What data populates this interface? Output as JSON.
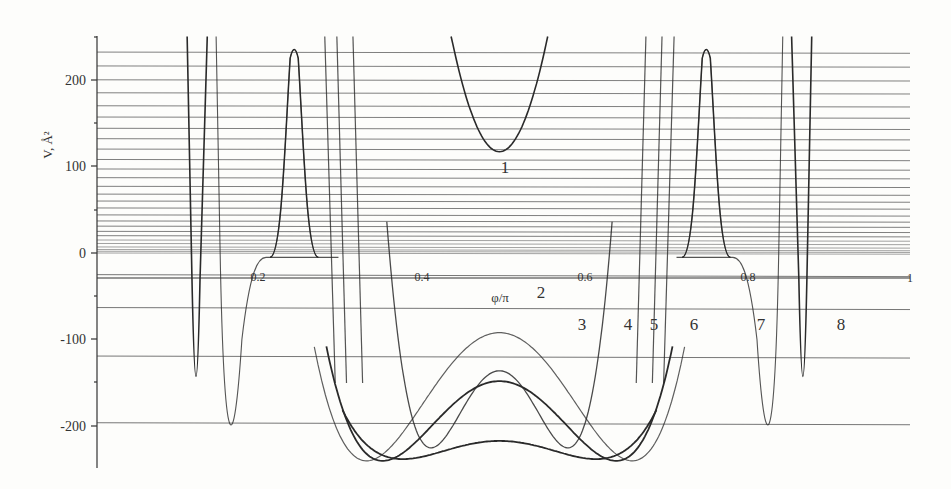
{
  "chart_data": {
    "type": "line",
    "title": "",
    "xlabel": "φ/π",
    "ylabel": "V, Å²",
    "xlim": [
      0,
      1
    ],
    "ylim": [
      -250,
      250
    ],
    "x_ticks": [
      0.2,
      0.4,
      0.6,
      0.8,
      1
    ],
    "x_tick_labels": [
      "0.2",
      "0.4",
      "0.6",
      "0.8",
      "1"
    ],
    "y_ticks": [
      -200,
      -100,
      0,
      100,
      200
    ],
    "y_tick_labels": [
      "-200",
      "-100",
      "0",
      "100",
      "200"
    ],
    "grid": false,
    "legend": "inline curve numbers",
    "energy_levels_upper": [
      232,
      216,
      200,
      185,
      170,
      157,
      144,
      132,
      120,
      108,
      97,
      87,
      77,
      68,
      60,
      52,
      44,
      37,
      31,
      25,
      20,
      15,
      11,
      7,
      4,
      2,
      0
    ],
    "energy_levels_lower": [
      -25,
      -63,
      -119,
      -196
    ],
    "series": [
      {
        "name": "1",
        "description": "single well above zero, minimum ~117 at φ/π=0.5",
        "min_x": 0.5,
        "min_y": 117
      },
      {
        "name": "2",
        "description": "double walls, inner barrier top ~-136 at φ/π=0.5, minima ~-225",
        "min_y": -225,
        "center_y": -136
      },
      {
        "name": "3",
        "description": "broad well, barrier top ~-92 at φ/π=0.5, minima ~-240 near φ/π≈0.33 and 0.67",
        "min_y": -240,
        "center_y": -92
      },
      {
        "name": "4",
        "description": "broad well, center ~-148, minima ~-240",
        "min_y": -240,
        "center_y": -148
      },
      {
        "name": "5",
        "description": "broad well, center ~-217, minima ~-238",
        "min_y": -238,
        "center_y": -217
      },
      {
        "name": "6",
        "description": "narrow barrier peaks ~233 at φ/π≈0.25 and 0.75, flat ~-5 plateau"
      },
      {
        "name": "7",
        "description": "narrow well, minimum ~-240 at φ/π≈0.2 and 0.8"
      },
      {
        "name": "8",
        "description": "narrowest well, minimum ~-242 at φ/π≈0.12 and 0.88"
      }
    ],
    "curve_label_positions": {
      "1": [
        0.5,
        105
      ],
      "2": [
        0.575,
        -49
      ],
      "3": [
        0.605,
        -90
      ],
      "4": [
        0.667,
        -90
      ],
      "5": [
        0.693,
        -90
      ],
      "6": [
        0.737,
        -90
      ],
      "7": [
        0.813,
        -90
      ],
      "8": [
        0.886,
        -90
      ]
    }
  },
  "axes": {
    "y_title": "V, Å²",
    "x_title": "φ/π",
    "y_ticks": [
      "200",
      "100",
      "0",
      "-100",
      "-200"
    ],
    "x_ticks": [
      "0.2",
      "0.4",
      "0.6",
      "0.8",
      "1"
    ]
  },
  "labels": {
    "c1": "1",
    "c2": "2",
    "c3": "3",
    "c4": "4",
    "c5": "5",
    "c6": "6",
    "c7": "7",
    "c8": "8"
  },
  "colors": {
    "ink": "#2a2a2a",
    "levels": "#555555",
    "background": "#fdfdfb"
  }
}
